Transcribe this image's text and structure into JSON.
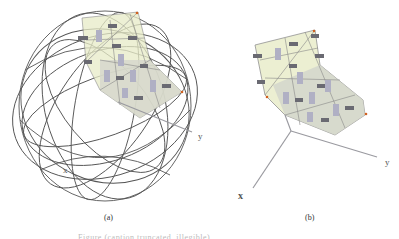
{
  "figure": {
    "subfigures": [
      {
        "label": "(a)",
        "description": "Wireframe sphere enclosing a curved patch of triangular mesh elements with small rectangular glyphs, plus coordinate axes"
      },
      {
        "label": "(b)",
        "description": "Curved patch of triangular mesh elements with rectangular glyphs and 3D coordinate axes, sphere removed"
      }
    ],
    "axes": {
      "x_label": "x",
      "y_label": "y"
    },
    "caption": "Figure (caption truncated, illegible)",
    "colors": {
      "sphere_wire": "#555555",
      "patch_fill_light": "#e8ecc8",
      "patch_fill_gray": "#d4d6cc",
      "glyph": "#6a6a72",
      "glyph_light": "#b8b8cc",
      "axis": "#9a9aa0",
      "corner_marker": "#d06020"
    }
  }
}
